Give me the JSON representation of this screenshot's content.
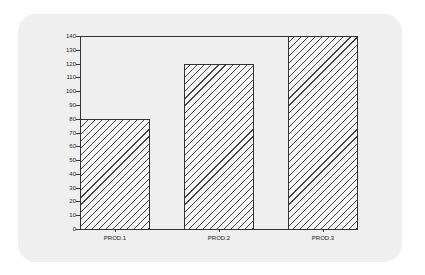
{
  "chart_data": {
    "type": "bar",
    "title": "",
    "xlabel": "",
    "ylabel": "",
    "categories": [
      "PROD.1",
      "PROD.2",
      "PROD.3"
    ],
    "values": [
      80,
      120,
      140
    ],
    "ylim": [
      0,
      140
    ],
    "yticks": [
      "0",
      "10",
      "20",
      "30",
      "40",
      "50",
      "60",
      "70",
      "80",
      "90",
      "100",
      "110",
      "120",
      "130",
      "140"
    ],
    "grid": false,
    "legend": null,
    "bar_fill": "diagonal hatch",
    "colors": {
      "panel": "#efefef",
      "axis": "#333333",
      "hatch": "#444444"
    }
  }
}
